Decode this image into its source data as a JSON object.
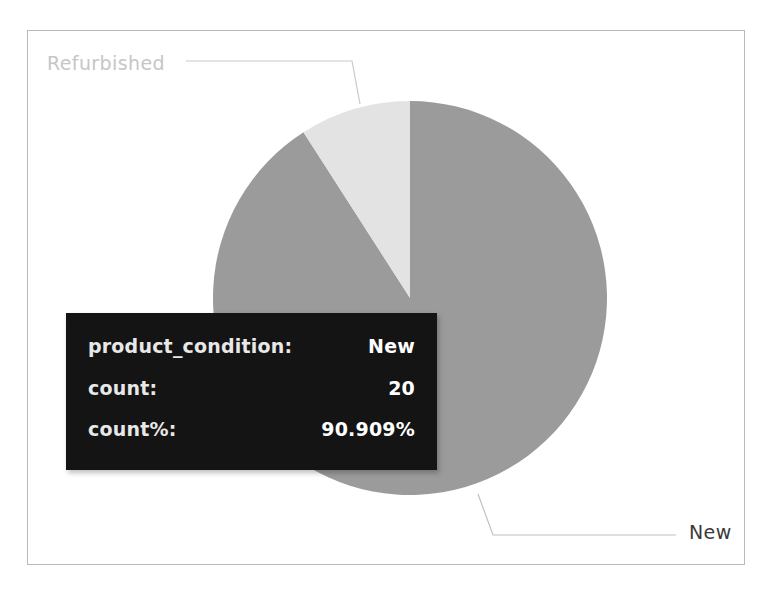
{
  "chart_data": {
    "type": "pie",
    "title": "",
    "categories": [
      "New",
      "Refurbished"
    ],
    "values": [
      20,
      2
    ],
    "percentages": [
      90.909,
      9.091
    ],
    "labels": [
      "New",
      "Refurbished"
    ],
    "colors": [
      "#9b9b9b",
      "#e3e3e3"
    ],
    "legend_position": "outside-labels",
    "grid": false,
    "field_name": "product_condition",
    "measure_name": "count",
    "total": 22,
    "annotations": [
      {
        "label": "Refurbished",
        "position": "top-left",
        "color": "#c6c6c6"
      },
      {
        "label": "New",
        "position": "bottom-right",
        "color": "#3a3a3a"
      }
    ]
  },
  "panel": {
    "border_color": "#b9b9b9",
    "background": "#ffffff"
  },
  "slices": [
    {
      "name": "New",
      "label": "New",
      "value": 20,
      "percent": "90.909%",
      "color": "#9b9b9b",
      "start_angle_deg": 0,
      "end_angle_deg": 327.27
    },
    {
      "name": "Refurbished",
      "label": "Refurbished",
      "value": 2,
      "percent": "9.091%",
      "color": "#e3e3e3",
      "start_angle_deg": 327.27,
      "end_angle_deg": 360
    }
  ],
  "tooltip": {
    "background": "#141414",
    "rows": [
      {
        "key": "product_condition:",
        "value": "New"
      },
      {
        "key": "count:",
        "value": "20"
      },
      {
        "key": "count%:",
        "value": "90.909%"
      }
    ]
  }
}
